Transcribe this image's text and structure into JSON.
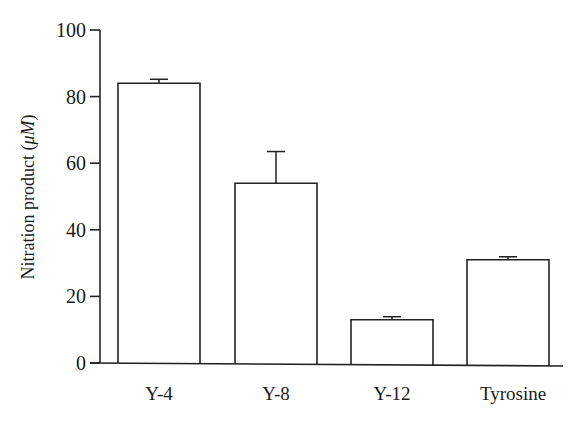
{
  "chart_data": {
    "type": "bar",
    "title": "",
    "xlabel": "",
    "ylabel": "Nitration product",
    "ylabel_unit": "μM",
    "categories": [
      "Y-4",
      "Y-8",
      "Y-12",
      "Tyrosine"
    ],
    "values": [
      84,
      54,
      13,
      31
    ],
    "error_upper": [
      1.2,
      9.5,
      0.9,
      0.9
    ],
    "ylim": [
      0,
      100
    ],
    "yticks": [
      0,
      20,
      40,
      60,
      80,
      100
    ],
    "ytick_labels": [
      "0",
      "20",
      "40",
      "60",
      "80",
      "100"
    ],
    "grid": false,
    "legend": null,
    "bar_fill": "#ffffff",
    "bar_stroke": "#222222"
  }
}
